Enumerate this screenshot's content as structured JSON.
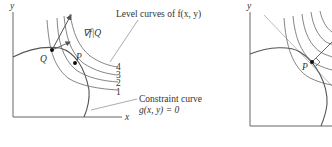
{
  "left_panel": {
    "axis_x_label": "x",
    "axis_y_label": "y",
    "point_q_label": "Q",
    "point_p_label": "P",
    "gradient_label": "∇f|Q",
    "level_curves_label": "Level curves of f(x, y)",
    "level_values": [
      "4",
      "3",
      "2",
      "1"
    ],
    "constraint_label_line1": "Constraint curve",
    "constraint_label_line2": "g(x, y) = 0"
  },
  "right_panel": {
    "axis_y_label": "y",
    "point_p_label": "P"
  },
  "colors": {
    "curve": "#555555",
    "axis": "#666666",
    "tangent": "#bbbbbb",
    "point": "#111111",
    "text": "#333333"
  }
}
